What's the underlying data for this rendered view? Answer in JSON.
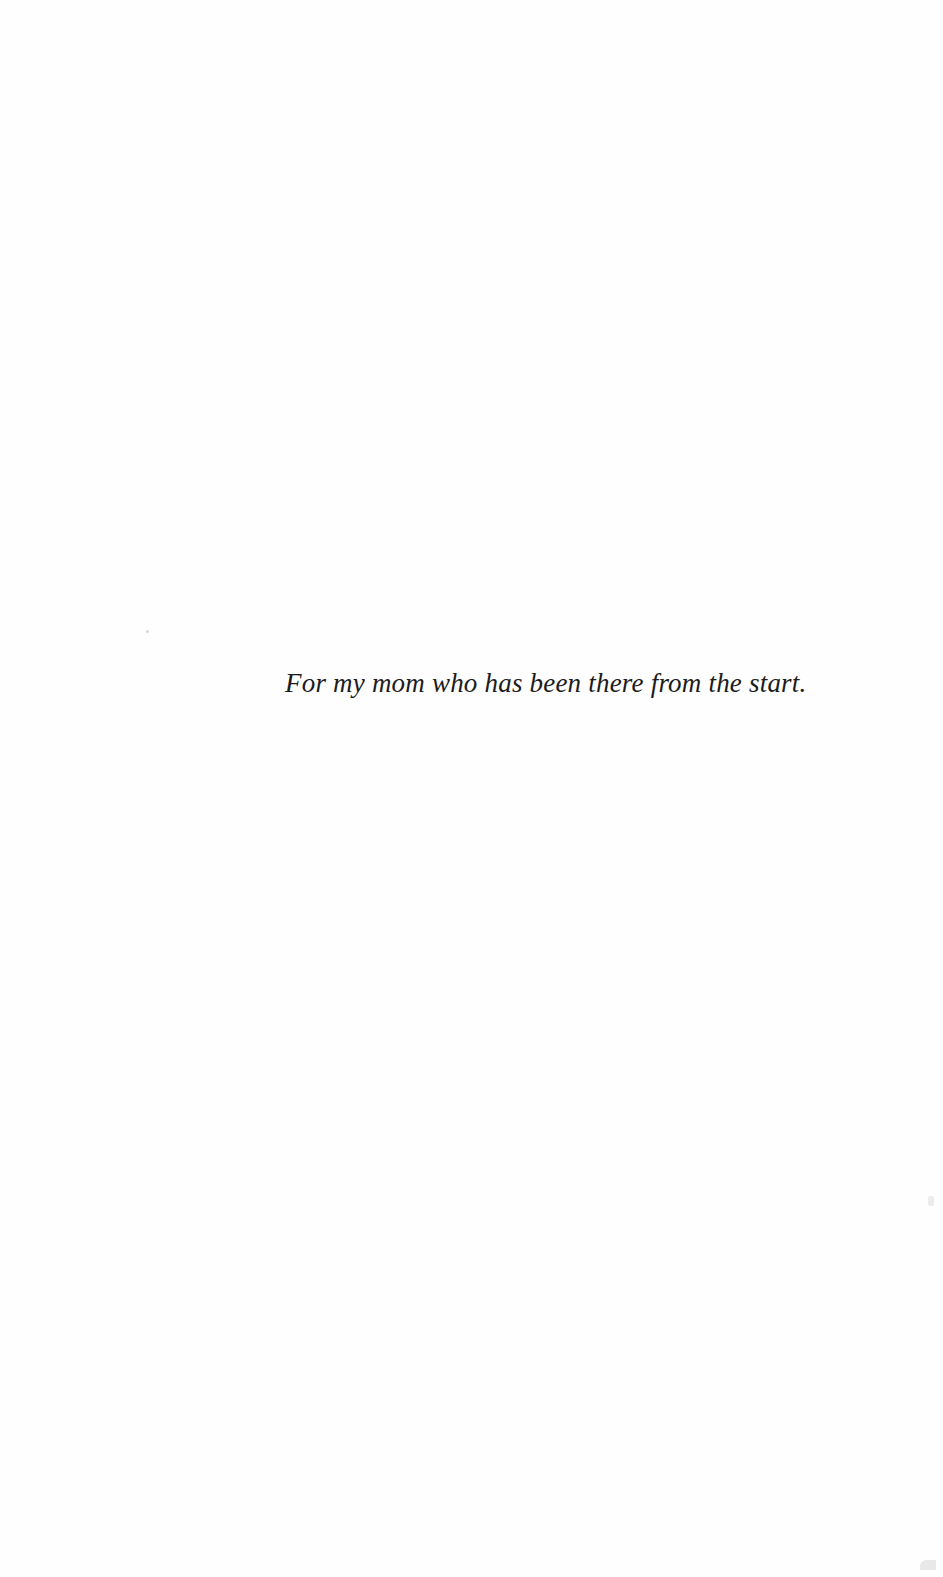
{
  "page": {
    "type": "dedication",
    "text": "For my mom who has been there from the start.",
    "background_color": "#fefefe",
    "text_color": "#1c1c1c"
  }
}
